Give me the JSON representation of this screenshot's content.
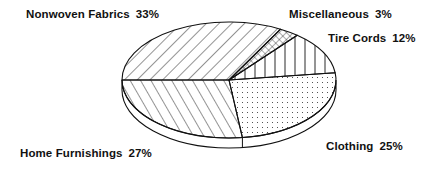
{
  "chart_data": {
    "type": "pie",
    "style": "3d-monochrome-hatched",
    "title": "",
    "categories": [
      "Nonwoven Fabrics",
      "Miscellaneous",
      "Tire Cords",
      "Clothing",
      "Home Furnishings"
    ],
    "values": [
      33,
      3,
      12,
      25,
      27
    ],
    "unit": "%",
    "labels": [
      {
        "name": "Nonwoven Fabrics",
        "pct": "33%",
        "pattern": "diagonal-backslash"
      },
      {
        "name": "Miscellaneous",
        "pct": "3%",
        "pattern": "crosshatch"
      },
      {
        "name": "Tire Cords",
        "pct": "12%",
        "pattern": "vertical-lines"
      },
      {
        "name": "Clothing",
        "pct": "25%",
        "pattern": "dots"
      },
      {
        "name": "Home Furnishings",
        "pct": "27%",
        "pattern": "diagonal-slash"
      }
    ],
    "legend": "none (direct labels)"
  },
  "colors": {
    "ink": "#111111",
    "background": "#ffffff"
  }
}
